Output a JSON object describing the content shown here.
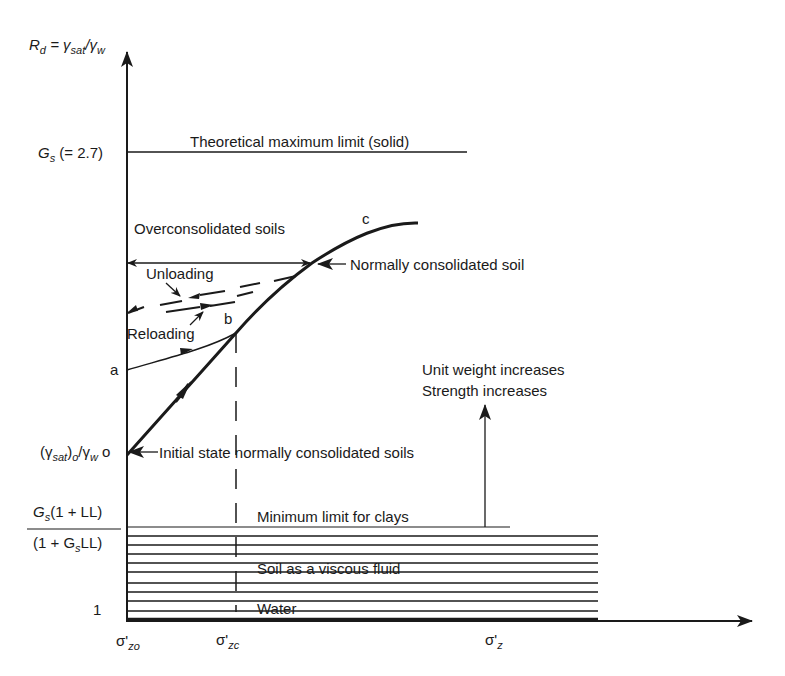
{
  "axes": {
    "y_label": "R_d = γsat/γw",
    "y_label_parts": {
      "R": "R",
      "R_sub": "d",
      "eq": " = γ",
      "g1_sub": "sat",
      "slash": "/γ",
      "g2_sub": "w"
    },
    "x_label": "σ'z",
    "x_ticks": [
      {
        "main": "σ'",
        "sub": "zo"
      },
      {
        "main": "σ'",
        "sub": "zc"
      },
      {
        "main": "σ'",
        "sub": "z"
      }
    ],
    "y_ticks": {
      "gs": {
        "main": "G",
        "sub": "s",
        "rest": " (= 2.7)"
      },
      "a": "a",
      "initial": {
        "open": "(γ",
        "sub1": "sat",
        "mid": ")",
        "sub2": "o",
        "slash": "/γ",
        "sub3": "w",
        "point": " o"
      },
      "fraction_num": {
        "main": "G",
        "sub": "s",
        "rest": "(1 + LL)"
      },
      "fraction_den": {
        "open": "(1 + G",
        "sub": "s",
        "rest": "LL)"
      },
      "one": "1"
    }
  },
  "labels": {
    "theoretical_max": "Theoretical maximum limit  (solid)",
    "overconsolidated": "Overconsolidated soils",
    "normally_consolidated": "Normally consolidated soil",
    "unloading": "Unloading",
    "reloading": "Reloading",
    "point_b": "b",
    "point_c": "c",
    "initial_state": "Initial state normally consolidated soils",
    "unit_weight": "Unit weight increases",
    "strength": "Strength increases",
    "min_limit": "Minimum limit for clays",
    "viscous_fluid": "Soil as a viscous fluid",
    "water": "Water"
  },
  "colors": {
    "ink": "#1a1a1a",
    "background": "#ffffff"
  }
}
